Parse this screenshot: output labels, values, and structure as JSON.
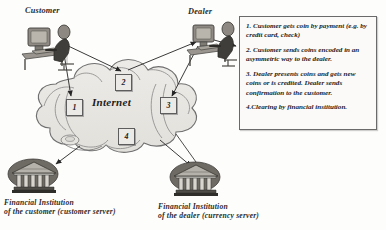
{
  "diagram": {
    "network_label": "Internet",
    "actors": {
      "customer": "Customer",
      "dealer": "Dealer",
      "bank_customer_line1": "Financial Institution",
      "bank_customer_line2": "of the customer (customer server)",
      "bank_dealer_line1": "Financial Institution",
      "bank_dealer_line2": "of the dealer (currency server)"
    },
    "step_markers": [
      {
        "id": "1",
        "label": "1"
      },
      {
        "id": "2",
        "label": "2"
      },
      {
        "id": "3",
        "label": "3"
      },
      {
        "id": "4",
        "label": "4"
      }
    ],
    "legend": {
      "steps": [
        "1. Customer gets coin by payment (e.g. by credit card, check)",
        "2. Customer sends coins encoded in an asymmetric way to the dealer.",
        "3. Dealer presents coins and gets new coins or is credited. Dealer sends confirmation to the customer.",
        "4.Clearing by financial institution."
      ]
    },
    "colors": {
      "cloud_fill": "#e8e6e2",
      "cloud_stroke": "#6f6f6f",
      "line": "#3a3a3a",
      "panel_border": "#6a6a6a",
      "text": "#1c1c1c"
    },
    "icons": {
      "customer": "workstation-icon",
      "dealer": "workstation-icon",
      "bank_customer": "bank-building-icon",
      "bank_dealer": "bank-building-icon",
      "network": "cloud-icon"
    }
  }
}
